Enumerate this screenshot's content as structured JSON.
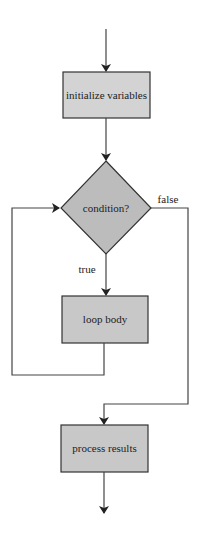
{
  "diagram": {
    "type": "flowchart",
    "nodes": {
      "init": {
        "label": "initialize variables",
        "shape": "rectangle"
      },
      "condition": {
        "label": "condition?",
        "shape": "diamond"
      },
      "body": {
        "label": "loop body",
        "shape": "rectangle"
      },
      "process": {
        "label": "process results",
        "shape": "rectangle"
      }
    },
    "edges": {
      "true_label": "true",
      "false_label": "false"
    },
    "colors": {
      "box_fill": "#cfcfcf",
      "diamond_fill": "#bdbdbd",
      "stroke": "#333333",
      "line": "#444444"
    }
  }
}
